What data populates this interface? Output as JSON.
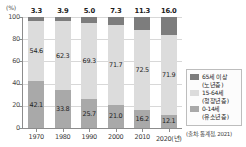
{
  "chart_data": {
    "type": "bar",
    "subtype": "stacked-100-percent",
    "title": "",
    "xlabel": "",
    "ylabel": "(%)",
    "ylim": [
      0,
      100
    ],
    "yticks": [
      "0",
      "20",
      "40",
      "60",
      "80",
      "100"
    ],
    "grid": true,
    "legend_position": "right",
    "categories": [
      "1970",
      "1980",
      "1990",
      "2000",
      "2010",
      "2020(년)"
    ],
    "series": [
      {
        "name": "65세 이상",
        "sublabel": "(노년층)",
        "color": "#7d7d7d",
        "values": [
          3.3,
          3.9,
          5.0,
          7.3,
          11.3,
          16.0
        ],
        "labels": [
          "3.3",
          "3.9",
          "5.0",
          "7.3",
          "11.3",
          "16.0"
        ]
      },
      {
        "name": "15-64세",
        "sublabel": "(청장년층)",
        "color": "#dcdcdc",
        "values": [
          54.6,
          62.3,
          69.3,
          71.7,
          72.5,
          71.9
        ],
        "labels": [
          "54.6",
          "62.3",
          "69.3",
          "71.7",
          "72.5",
          "71.9"
        ]
      },
      {
        "name": "0-14세",
        "sublabel": "(유소년층)",
        "color": "#a9a9a9",
        "values": [
          42.1,
          33.8,
          25.7,
          21.0,
          16.2,
          12.1
        ],
        "labels": [
          "42.1",
          "33.8",
          "25.7",
          "21.0",
          "16.2",
          "12.1"
        ]
      }
    ],
    "source_note": "(출처: 통계청, 2021)"
  }
}
